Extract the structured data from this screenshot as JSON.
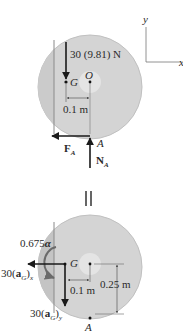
{
  "figure": {
    "free_body_diagram": {
      "weight_label": "30 (9.81) N",
      "point_G": "G",
      "point_O": "O",
      "point_A": "A",
      "dimension_x": "0.1 m",
      "friction_force": {
        "symbol": "F",
        "subscript": "A"
      },
      "normal_force": {
        "symbol": "N",
        "subscript": "A"
      },
      "axes": {
        "y": "y",
        "x": "x"
      }
    },
    "equals_sign": "||",
    "kinetic_diagram": {
      "moment_label": {
        "value": "0.675",
        "symbol": "α"
      },
      "inertia_x": {
        "prefix": "30(",
        "symbol": "a",
        "subscript": "G",
        "suffix": ")",
        "axis_sub": "x"
      },
      "inertia_y": {
        "prefix": "30(",
        "symbol": "a",
        "subscript": "G",
        "suffix": ")",
        "axis_sub": "y"
      },
      "point_G": "G",
      "point_A": "A",
      "dimension_x": "0.1 m",
      "dimension_y": "0.25 m"
    },
    "colors": {
      "disk_fill": "#d4d4d4",
      "disk_edge": "#bdbdbd",
      "hub_fill": "#e6e6e6",
      "arrow": "#1a1a1a",
      "dimension_line": "#444444",
      "strip_shade": "#c4c4c4"
    }
  }
}
